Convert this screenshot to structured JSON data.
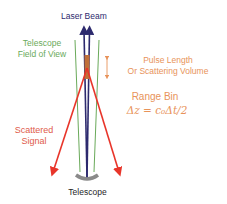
{
  "diagram": {
    "labels": {
      "laser_beam": "Laser Beam",
      "telescope_fov_line1": "Telescope",
      "telescope_fov_line2": "Field of View",
      "pulse_line1": "Pulse Length",
      "pulse_line2": "Or Scattering Volume",
      "range_bin": "Range Bin",
      "formula": "Δz = c₀Δt/2",
      "scattered_line1": "Scattered",
      "scattered_line2": "Signal",
      "telescope": "Telescope"
    },
    "colors": {
      "laser_beam": "#2d2a6e",
      "field_of_view": "#6aaa5a",
      "pulse_volume": "#c0703a",
      "annotation": "#e8935a",
      "scattered_signal": "#e8352a",
      "telescope_mirror": "#8a8a8a",
      "telescope_label": "#1f1f1f"
    },
    "elements": [
      "laser-beam-arrows",
      "field-of-view-lines",
      "scattering-volume-bar",
      "pulse-length-double-arrow",
      "scattered-signal-arrows",
      "telescope-mirror"
    ]
  }
}
